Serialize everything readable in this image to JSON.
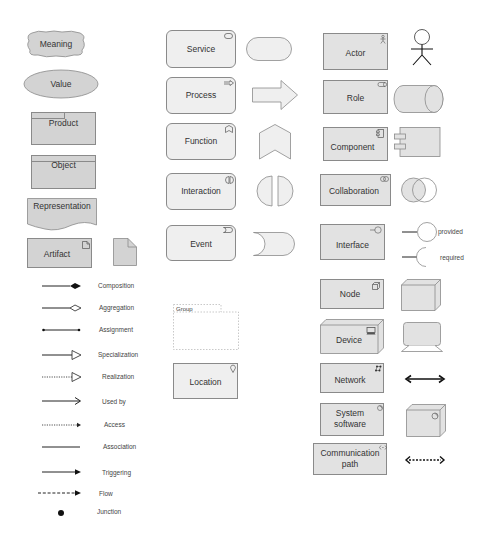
{
  "business": {
    "meaning": "Meaning",
    "value": "Value",
    "product": "Product",
    "object": "Object",
    "representation": "Representation",
    "artifact": "Artifact"
  },
  "relations": [
    {
      "label": "Composition",
      "style": "solid",
      "end": "filled-diamond"
    },
    {
      "label": "Aggregation",
      "style": "solid",
      "end": "hollow-diamond"
    },
    {
      "label": "Assignment",
      "style": "solid",
      "end": "dots"
    },
    {
      "label": "Specialization",
      "style": "solid",
      "end": "hollow-triangle"
    },
    {
      "label": "Realization",
      "style": "dotted",
      "end": "hollow-triangle"
    },
    {
      "label": "Used by",
      "style": "solid",
      "end": "open-arrow"
    },
    {
      "label": "Access",
      "style": "dotted",
      "end": "small-arrow"
    },
    {
      "label": "Association",
      "style": "solid",
      "end": "none"
    },
    {
      "label": "Triggering",
      "style": "solid",
      "end": "filled-arrow"
    },
    {
      "label": "Flow",
      "style": "dashed",
      "end": "filled-arrow"
    },
    {
      "label": "Junction",
      "style": "none",
      "end": "dot"
    }
  ],
  "behavior": {
    "service": "Service",
    "process": "Process",
    "function": "Function",
    "interaction": "Interaction",
    "event": "Event",
    "group": "Group",
    "location": "Location"
  },
  "active": {
    "actor": "Actor",
    "role": "Role",
    "component": "Component",
    "collaboration": "Collaboration",
    "interface": "Interface",
    "provided": "provided",
    "required": "required",
    "node": "Node",
    "device": "Device",
    "network": "Network",
    "system_software_1": "System",
    "system_software_2": "software",
    "communication_path_1": "Communication",
    "communication_path_2": "path"
  },
  "colors": {
    "business_fill": "#d3d3d3",
    "behavior_fill": "#efefef",
    "active_fill": "#e2e2e2",
    "stroke": "#8a8a8a"
  }
}
